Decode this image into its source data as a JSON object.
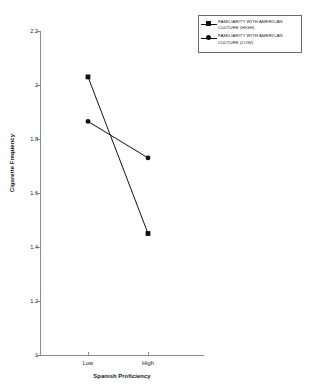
{
  "chart_data": {
    "type": "line",
    "title": "",
    "xlabel": "Spanish Proficiency",
    "ylabel": "Cigarette Frequency",
    "categories": [
      "Low",
      "High"
    ],
    "yticks": [
      "2.2",
      "2",
      "1.8",
      "1.6",
      "1.4",
      "1.2",
      "1"
    ],
    "ylim": [
      1,
      2.2
    ],
    "grid": false,
    "legend_position": "top-right",
    "series": [
      {
        "name": "FAMILIARITY WITH AMERICAN CULTURE (HIGH)",
        "label_line1": "FAMILIARITY WITH AMERICAN",
        "label_line2": "CULTURE (HIGH)",
        "marker": "square",
        "color": "#111111",
        "values": [
          2.03,
          1.45
        ]
      },
      {
        "name": "FAMILIARITY WITH AMERICAN CULTURE (LOW)",
        "label_line1": "FAMILIARITY WITH AMERICAN",
        "label_line2": "CULTURE (LOW)",
        "marker": "circle",
        "color": "#111111",
        "values": [
          1.865,
          1.73
        ]
      }
    ]
  },
  "axes": {
    "y_title": "Cigarette Frequency",
    "x_title": "Spanish Proficiency",
    "y_tick_labels": [
      "2.2",
      "2",
      "1.8",
      "1.6",
      "1.4",
      "1.2",
      "1"
    ],
    "x_tick_labels": [
      "Low",
      "High"
    ]
  },
  "legend": {
    "entries": [
      {
        "line1": "FAMILIARITY WITH AMERICAN",
        "line2": "CULTURE (HIGH)",
        "marker": "square"
      },
      {
        "line1": "FAMILIARITY WITH AMERICAN",
        "line2": "CULTURE (LOW)",
        "marker": "circle"
      }
    ]
  }
}
